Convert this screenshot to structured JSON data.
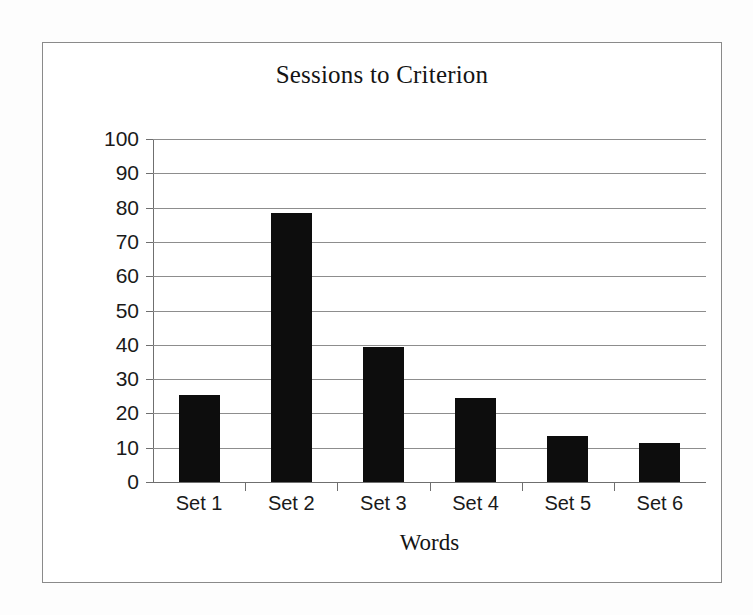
{
  "chart_data": {
    "type": "bar",
    "title": "Sessions to Criterion",
    "xlabel": "Words",
    "ylabel": "",
    "categories": [
      "Set 1",
      "Set 2",
      "Set 3",
      "Set 4",
      "Set 5",
      "Set 6"
    ],
    "values": [
      25.5,
      78.5,
      39.5,
      24.5,
      13.5,
      11.5
    ],
    "ylim": [
      0,
      100
    ],
    "ytick_step": 10,
    "yticks": [
      "100",
      "90",
      "80",
      "70",
      "60",
      "50",
      "40",
      "30",
      "20",
      "10",
      "0"
    ],
    "ytick_values": [
      100,
      90,
      80,
      70,
      60,
      50,
      40,
      30,
      20,
      10,
      0
    ],
    "grid": true,
    "legend": false,
    "legend_position": "none",
    "series": [
      {
        "name": "Sessions to Criterion",
        "values": [
          25.5,
          78.5,
          39.5,
          24.5,
          13.5,
          11.5
        ]
      }
    ],
    "colors": {
      "bar": "#0d0d0d",
      "gridline": "#8d8d8d",
      "axis": "#6f6f6f",
      "frame": "#8a8a8a",
      "background": "#ffffff",
      "page": "#fdfdfd",
      "text": "#1a1a1a"
    }
  }
}
